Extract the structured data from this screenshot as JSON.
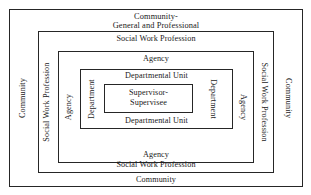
{
  "diagram": {
    "title_line1": "Community-",
    "title_line2": "General and Professional",
    "rings": [
      {
        "id": "community",
        "top_label_line1": "Community-",
        "top_label_line2": "General and Professional",
        "bottom_label": "Community",
        "left_label": "Community",
        "right_label": "Community"
      },
      {
        "id": "social-work-profession",
        "top_label": "Social Work Profession",
        "bottom_label": "Social Work Profession",
        "left_label": "Social Work Profession",
        "right_label": "Social Work Profession"
      },
      {
        "id": "agency",
        "top_label": "Agency",
        "bottom_label": "Agency",
        "left_label": "Agency",
        "right_label": "Agency"
      },
      {
        "id": "departmental-unit",
        "top_label": "Departmental Unit",
        "bottom_label": "Departmental Unit",
        "left_label": "Department",
        "right_label": "Department"
      },
      {
        "id": "supervisor-supervisee",
        "center_label_line1": "Supervisor-",
        "center_label_line2": "Supervisee"
      }
    ],
    "colors": {
      "background": "#ffffff",
      "line": "#262626",
      "text": "#1a1a1a"
    }
  }
}
